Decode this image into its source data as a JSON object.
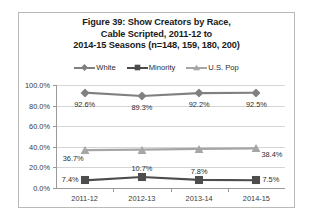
{
  "chart_data": {
    "type": "line",
    "title": "Figure 39:  Show Creators by Race, Cable Scripted, 2011-12 to 2014-15 Seasons (n=148, 159, 180, 200)",
    "title_lines": [
      "Figure 39:  Show Creators by Race,",
      "Cable Scripted, 2011-12 to",
      "2014-15 Seasons (n=148, 159, 180, 200)"
    ],
    "categories": [
      "2011-12",
      "2012-13",
      "2013-14",
      "2014-15"
    ],
    "series": [
      {
        "name": "White",
        "values": [
          92.6,
          89.3,
          92.2,
          92.5
        ],
        "labels": [
          "92.6%",
          "89.3%",
          "92.2%",
          "92.5%"
        ],
        "marker": "diamond",
        "color": "#808080"
      },
      {
        "name": "Minority",
        "values": [
          7.4,
          10.7,
          7.8,
          7.5
        ],
        "labels": [
          "7.4%",
          "10.7%",
          "7.8%",
          "7.5%"
        ],
        "marker": "square",
        "color": "#4d4d4d"
      },
      {
        "name": "U.S. Pop",
        "values": [
          36.7,
          37.3,
          37.9,
          38.4
        ],
        "labels": [
          "36.7%",
          "",
          "",
          "38.4%"
        ],
        "marker": "triangle",
        "color": "#a6a6a6"
      }
    ],
    "ylabel": "",
    "xlabel": "",
    "ylim": [
      0,
      100
    ],
    "yticks": [
      0,
      20,
      40,
      60,
      80,
      100
    ],
    "ytick_labels": [
      "0.0%",
      "20.0%",
      "40.0%",
      "60.0%",
      "80.0%",
      "100.0%"
    ],
    "grid": true,
    "legend_position": "top"
  },
  "legend": {
    "entries": [
      {
        "label": "White",
        "marker": "diamond-icon",
        "color": "#808080"
      },
      {
        "label": "Minority",
        "marker": "square-icon",
        "color": "#4d4d4d"
      },
      {
        "label": "U.S. Pop",
        "marker": "triangle-icon",
        "color": "#a6a6a6"
      }
    ]
  }
}
